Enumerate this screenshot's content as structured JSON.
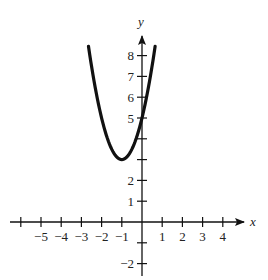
{
  "chart_data": {
    "type": "line",
    "title": "",
    "xlabel": "x",
    "ylabel": "y",
    "function": "y = 2(x+1)^2 + 3",
    "vertex": [
      -1,
      3
    ],
    "y_intercept": 5,
    "xlim": [
      -6.3,
      4.9
    ],
    "ylim": [
      -2.6,
      8.9
    ],
    "x_ticks": [
      -6,
      -5,
      -4,
      -3,
      -2,
      -1,
      1,
      2,
      3,
      4
    ],
    "x_tick_labels": [
      {
        "value": -5,
        "label": "−5"
      },
      {
        "value": -4,
        "label": "−4"
      },
      {
        "value": -3,
        "label": "−3"
      },
      {
        "value": -2,
        "label": "−2"
      },
      {
        "value": -1,
        "label": "−1"
      },
      {
        "value": 1,
        "label": "1"
      },
      {
        "value": 2,
        "label": "2"
      },
      {
        "value": 3,
        "label": "3"
      },
      {
        "value": 4,
        "label": "4"
      }
    ],
    "y_ticks": [
      -2,
      -1,
      1,
      2,
      3,
      4,
      5,
      6,
      7,
      8
    ],
    "y_tick_labels": [
      {
        "value": 8,
        "label": "8"
      },
      {
        "value": 7,
        "label": "7"
      },
      {
        "value": 6,
        "label": "6"
      },
      {
        "value": 5,
        "label": "5"
      },
      {
        "value": 2,
        "label": "2"
      },
      {
        "value": 1,
        "label": "1"
      },
      {
        "value": -2,
        "label": "−2"
      }
    ],
    "series": [
      {
        "name": "parabola",
        "x": [
          -2.65,
          -2.5,
          -2,
          -1.5,
          -1,
          -0.5,
          0,
          0.5,
          0.65
        ],
        "y": [
          8.45,
          7.5,
          5,
          3.5,
          3,
          3.5,
          5,
          7.5,
          8.45
        ]
      }
    ],
    "grid": false,
    "legend": null
  }
}
